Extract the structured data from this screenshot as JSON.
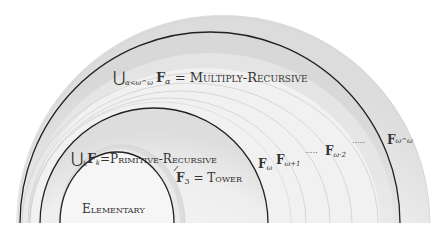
{
  "diagram": {
    "type": "nested-hierarchy-arcs",
    "baseline_y": 223,
    "colors": {
      "dark_stroke": "#222222",
      "light_stroke": "#cfcfcf",
      "fill_outer": "#e6e6e6",
      "fill_light": "#f2f2f2",
      "fill_mid": "#dedede",
      "text": "#333333"
    },
    "labels": {
      "multiply_recursive": {
        "union": "⋃",
        "sub": "α<ω^ω",
        "F": "F",
        "F_sub": "α",
        "eq": " = ",
        "name": "Multiply-Recursive"
      },
      "primitive_recursive": {
        "union": "⋃",
        "sub": "k",
        "F": "F",
        "F_sub": "k",
        "eq": "=",
        "name": "Primitive-Recursive"
      },
      "tower": {
        "F": "F",
        "F_sub": "3",
        "eq": " = ",
        "name": "Tower"
      },
      "elementary": {
        "name": "Elementary"
      },
      "f_omega": {
        "F": "F",
        "F_sub": "ω"
      },
      "f_omega_plus_1": {
        "F": "F",
        "F_sub": "ω+1"
      },
      "f_omega_times_2": {
        "F": "F",
        "F_sub": "ω·2"
      },
      "f_omega_omega": {
        "F": "F",
        "F_sub": "ω^ω"
      },
      "ellipsis_1": "·····",
      "ellipsis_2": "·····"
    }
  }
}
